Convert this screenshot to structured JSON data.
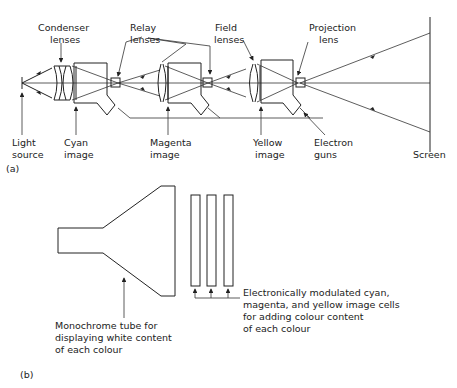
{
  "figure_a": {
    "panel_label": "(a)",
    "labels": {
      "condenser": [
        "Condenser",
        "lenses"
      ],
      "relay": [
        "Relay",
        "lenses"
      ],
      "field": [
        "Field",
        "lenses"
      ],
      "projection": [
        "Projection",
        "lens"
      ],
      "light_source": [
        "Light",
        "source"
      ],
      "cyan": [
        "Cyan",
        "image"
      ],
      "magenta": [
        "Magenta",
        "image"
      ],
      "yellow": [
        "Yellow",
        "image"
      ],
      "electron_guns": [
        "Electron",
        "guns"
      ],
      "screen": [
        "Screen"
      ]
    }
  },
  "figure_b": {
    "panel_label": "(b)",
    "labels": {
      "monochrome": [
        "Monochrome tube for",
        "displaying white content",
        "of each colour"
      ],
      "cells": [
        "Electronically modulated cyan,",
        "magenta, and yellow image cells",
        "for adding colour content",
        "of each colour"
      ]
    }
  }
}
